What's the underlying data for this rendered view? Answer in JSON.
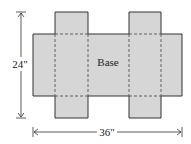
{
  "diagram": {
    "base_label": "Base",
    "height_label": "24\"",
    "width_label": "36\"",
    "colors": {
      "fill": "#d6d6d6",
      "stroke": "#333333",
      "dash": "#555555",
      "background": "#ffffff"
    }
  }
}
